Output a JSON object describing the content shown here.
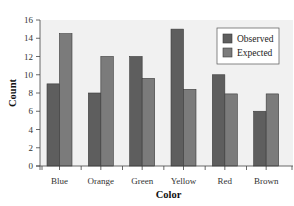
{
  "chart_data": {
    "type": "bar",
    "title": "",
    "xlabel": "Color",
    "ylabel": "Count",
    "categories": [
      "Blue",
      "Orange",
      "Green",
      "Yellow",
      "Red",
      "Brown"
    ],
    "series": [
      {
        "name": "Observed",
        "color": "#5e5e5e",
        "values": [
          9,
          8,
          12,
          15,
          10,
          6
        ]
      },
      {
        "name": "Expected",
        "color": "#7b7b7b",
        "values": [
          14.5,
          12,
          9.6,
          8.4,
          7.9,
          7.9
        ]
      }
    ],
    "ylim": [
      0,
      16
    ],
    "yticks": [
      0,
      2,
      4,
      6,
      8,
      10,
      12,
      14,
      16
    ],
    "grid": false,
    "legend_position": "upper right",
    "plot_background": "#f1f1f1"
  }
}
